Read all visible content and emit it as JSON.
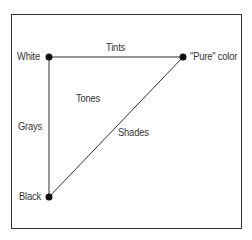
{
  "diagram": {
    "type": "color-triangle",
    "nodes": [
      {
        "id": "white",
        "label": "White"
      },
      {
        "id": "pure",
        "label": "\"Pure\" color"
      },
      {
        "id": "black",
        "label": "Black"
      }
    ],
    "edges": [
      {
        "from": "white",
        "to": "pure",
        "label": "Tints"
      },
      {
        "from": "white",
        "to": "black",
        "label": "Grays"
      },
      {
        "from": "black",
        "to": "pure",
        "label": "Shades"
      }
    ],
    "interior_label": "Tones",
    "colors": {
      "line": "#333333",
      "dot": "#111111",
      "text": "#333333",
      "background": "#ffffff"
    }
  }
}
